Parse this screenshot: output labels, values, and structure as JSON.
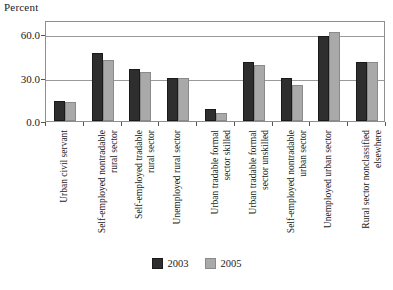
{
  "chart_data": {
    "type": "bar",
    "title": "",
    "xlabel": "",
    "ylabel": "Percent",
    "ylim": [
      0,
      70
    ],
    "yticks": [
      "0.0",
      "30.0",
      "60.0"
    ],
    "ytick_values": [
      0,
      30,
      60
    ],
    "grid": true,
    "legend_position": "bottom-center",
    "categories": [
      "Urban civil servant",
      "Self-employed nontradable rural sector",
      "Self-employed tradable rural sector",
      "Unemployed rural sector",
      "Urban tradable formal sector skilled",
      "Urban tradable formal sector unskilled",
      "Self-employed nontradable urban sector",
      "Unemployed urban sector",
      "Rural sector nonclassified elsewhere"
    ],
    "category_lines": [
      [
        "Urban civil servant",
        ""
      ],
      [
        "Self-employed nontradable",
        "rural sector"
      ],
      [
        "Self-employed tradable",
        "rural sector"
      ],
      [
        "Unemployed rural sector",
        ""
      ],
      [
        "Urban tradable formal",
        "sector skilled"
      ],
      [
        "Urban tradable formal",
        "sector unskilled"
      ],
      [
        "Self-employed nontradable",
        "urban sector"
      ],
      [
        "Unemployed urban sector",
        ""
      ],
      [
        "Rural sector nonclassified",
        "elsewhere"
      ]
    ],
    "series": [
      {
        "name": "2003",
        "color": "#2e2e2e",
        "values": [
          14.0,
          47.0,
          36.0,
          30.0,
          8.0,
          41.0,
          30.0,
          59.0,
          41.0
        ]
      },
      {
        "name": "2005",
        "color": "#a9a9a9",
        "values": [
          13.5,
          42.0,
          34.0,
          30.0,
          5.5,
          39.0,
          25.0,
          61.5,
          41.0
        ]
      }
    ]
  }
}
